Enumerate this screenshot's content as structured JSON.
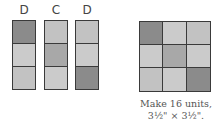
{
  "colors": {
    "dark": "#8b8b8b",
    "medium": "#a8a8a8",
    "light": "#cbcbcb",
    "lighter": "#c2c2c2",
    "border": "#3a3a3a"
  },
  "strips": [
    {
      "label": "D",
      "cells": [
        "dark",
        "light",
        "lighter"
      ]
    },
    {
      "label": "C",
      "cells": [
        "lighter",
        "medium",
        "light"
      ]
    },
    {
      "label": "D",
      "cells": [
        "lighter",
        "light",
        "dark"
      ]
    }
  ],
  "unit_grid": {
    "rows": [
      [
        "dark",
        "light",
        "lighter"
      ],
      [
        "light",
        "medium",
        "light"
      ],
      [
        "lighter",
        "light",
        "dark"
      ]
    ],
    "arrows": [
      "left-arrow",
      "right-arrow"
    ]
  },
  "caption": {
    "line1": "Make 16 units,",
    "line2": "3½\" × 3½\"."
  }
}
